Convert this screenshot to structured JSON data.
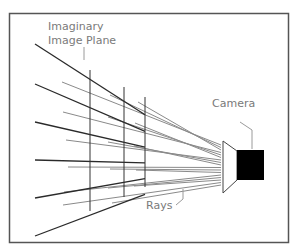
{
  "diagram": {
    "labels": {
      "image_plane_line1": "Imaginary",
      "image_plane_line2": "Image Plane",
      "camera": "Camera",
      "rays": "Rays"
    },
    "colors": {
      "frame": "#555555",
      "dark_rays": "#2a2a2a",
      "light_rays": "#8a8a8a",
      "label_text": "#7a7a7a",
      "camera_body": "#000000"
    }
  }
}
